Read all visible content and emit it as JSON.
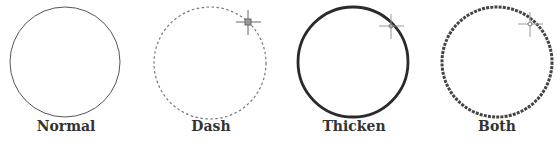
{
  "figure": {
    "panels": [
      {
        "id": "normal",
        "label": "Normal",
        "style": "solid-thin",
        "crosshair": false
      },
      {
        "id": "dash",
        "label": "Dash",
        "style": "dashed-thin",
        "crosshair": true
      },
      {
        "id": "thicken",
        "label": "Thicken",
        "style": "solid-thick",
        "crosshair": true
      },
      {
        "id": "both",
        "label": "Both",
        "style": "dashed-thick",
        "crosshair": true
      }
    ],
    "colors": {
      "stroke": "#333333",
      "crosshair": "#888888",
      "background": "#ffffff"
    }
  }
}
